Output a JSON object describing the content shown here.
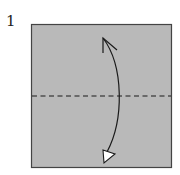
{
  "step": {
    "number": "1"
  },
  "diagram": {
    "paper_color": "#b9b9b9",
    "edge_color": "#444444",
    "line_color": "#1a1a1a",
    "fold_line": "valley-fold-horizontal-center",
    "arrow": "fold-bottom-to-top-and-unfold"
  }
}
